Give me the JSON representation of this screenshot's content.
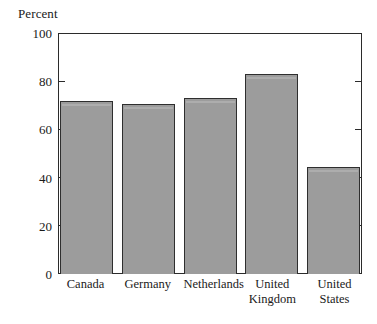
{
  "chart_data": {
    "type": "bar",
    "title": "",
    "ylabel": "Percent",
    "xlabel": "",
    "categories": [
      "Canada",
      "Germany",
      "Netherlands",
      "United Kingdom",
      "United States"
    ],
    "category_lines": [
      [
        "Canada",
        ""
      ],
      [
        "Germany",
        ""
      ],
      [
        "Netherlands",
        ""
      ],
      [
        "United",
        "Kingdom"
      ],
      [
        "United",
        "States"
      ]
    ],
    "values": [
      72,
      71,
      73.5,
      83.5,
      44.5
    ],
    "ylim": [
      0,
      100
    ],
    "yticks": [
      0,
      20,
      40,
      60,
      80,
      100
    ],
    "ytick_labels": [
      "0",
      "20",
      "40",
      "60",
      "80",
      "100"
    ],
    "grid": false,
    "legend": null,
    "bar_color": "#9c9c9c",
    "bar_edge_color": "#2e2e2e",
    "axis_color": "#2b2b2b",
    "background_color": "#ffffff"
  },
  "axis": {
    "y_title": "Percent"
  }
}
